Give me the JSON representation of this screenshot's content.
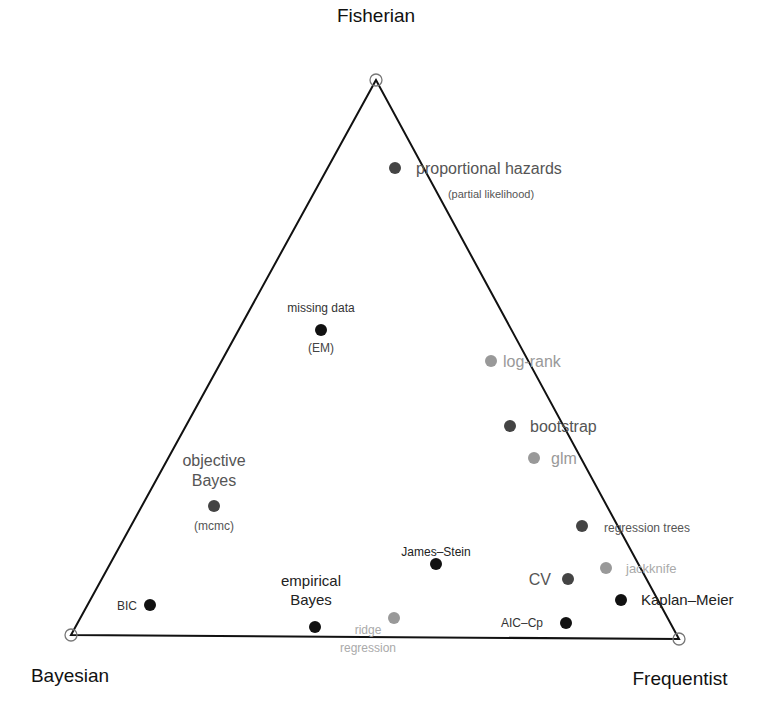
{
  "vertices": [
    {
      "id": "fisherian",
      "label": "Fisherian",
      "x": 376,
      "y": 80,
      "label_x": 376,
      "label_y": 22,
      "label_anchor": "middle",
      "font_size": 19
    },
    {
      "id": "bayesian",
      "label": "Bayesian",
      "x": 71,
      "y": 635,
      "label_x": 70,
      "label_y": 682,
      "label_anchor": "middle",
      "font_size": 19
    },
    {
      "id": "frequentist",
      "label": "Frequentist",
      "x": 679,
      "y": 639,
      "label_x": 680,
      "label_y": 685,
      "label_anchor": "middle",
      "font_size": 19
    }
  ],
  "triangle": {
    "stroke": "#111111",
    "stroke_width": 2,
    "vertex_circle_radius": 6
  },
  "colors": {
    "black": "#111111",
    "dark": "#444444",
    "gray": "#999999"
  },
  "points": [
    {
      "id": "proportional-hazards",
      "x": 395,
      "y": 168,
      "color": "dark",
      "labels": [
        {
          "text": "proportional hazards",
          "x": 416,
          "y": 174,
          "anchor": "start",
          "size": 16,
          "color": "#555555"
        },
        {
          "text": "(partial likelihood)",
          "x": 491,
          "y": 198,
          "anchor": "middle",
          "size": 11,
          "color": "#555555"
        }
      ]
    },
    {
      "id": "missing-data",
      "x": 321,
      "y": 330,
      "color": "black",
      "labels": [
        {
          "text": "missing data",
          "x": 321,
          "y": 312,
          "anchor": "middle",
          "size": 12,
          "color": "#333333"
        },
        {
          "text": "(EM)",
          "x": 321,
          "y": 352,
          "anchor": "middle",
          "size": 12,
          "color": "#444444"
        }
      ]
    },
    {
      "id": "log-rank",
      "x": 491,
      "y": 361,
      "color": "gray",
      "labels": [
        {
          "text": "log-rank",
          "x": 503,
          "y": 367,
          "anchor": "start",
          "size": 16,
          "color": "#999999"
        }
      ]
    },
    {
      "id": "bootstrap",
      "x": 510,
      "y": 426,
      "color": "dark",
      "labels": [
        {
          "text": "bootstrap",
          "x": 530,
          "y": 432,
          "anchor": "start",
          "size": 16,
          "color": "#555555"
        }
      ]
    },
    {
      "id": "glm",
      "x": 534,
      "y": 458,
      "color": "gray",
      "labels": [
        {
          "text": "glm",
          "x": 551,
          "y": 464,
          "anchor": "start",
          "size": 16,
          "color": "#999999"
        }
      ]
    },
    {
      "id": "objective-bayes",
      "x": 214,
      "y": 506,
      "color": "dark",
      "labels": [
        {
          "text": "objective",
          "x": 214,
          "y": 466,
          "anchor": "middle",
          "size": 16,
          "color": "#555555"
        },
        {
          "text": "Bayes",
          "x": 214,
          "y": 486,
          "anchor": "middle",
          "size": 16,
          "color": "#555555"
        },
        {
          "text": "(mcmc)",
          "x": 214,
          "y": 530,
          "anchor": "middle",
          "size": 12,
          "color": "#555555"
        }
      ]
    },
    {
      "id": "regression-trees",
      "x": 582,
      "y": 526,
      "color": "dark",
      "labels": [
        {
          "text": "regression trees",
          "x": 604,
          "y": 532,
          "anchor": "start",
          "size": 12,
          "color": "#555555"
        }
      ]
    },
    {
      "id": "james-stein",
      "x": 436,
      "y": 564,
      "color": "black",
      "labels": [
        {
          "text": "James–Stein",
          "x": 436,
          "y": 556,
          "anchor": "middle",
          "size": 12,
          "color": "#222222"
        }
      ]
    },
    {
      "id": "jackknife",
      "x": 606,
      "y": 568,
      "color": "gray",
      "labels": [
        {
          "text": "jackknife",
          "x": 626,
          "y": 573,
          "anchor": "start",
          "size": 13,
          "color": "#aaaaaa"
        }
      ]
    },
    {
      "id": "cv",
      "x": 568,
      "y": 579,
      "color": "dark",
      "labels": [
        {
          "text": "CV",
          "x": 551,
          "y": 585,
          "anchor": "end",
          "size": 16,
          "color": "#555555"
        }
      ]
    },
    {
      "id": "kaplan-meier",
      "x": 621,
      "y": 600,
      "color": "black",
      "labels": [
        {
          "text": "Kaplan–Meier",
          "x": 641,
          "y": 605,
          "anchor": "start",
          "size": 15,
          "color": "#222222"
        }
      ]
    },
    {
      "id": "bic",
      "x": 150,
      "y": 605,
      "color": "black",
      "labels": [
        {
          "text": "BIC",
          "x": 137,
          "y": 610,
          "anchor": "end",
          "size": 12,
          "color": "#333333"
        }
      ]
    },
    {
      "id": "empirical-bayes",
      "x": 315,
      "y": 627,
      "color": "black",
      "labels": [
        {
          "text": "empirical",
          "x": 311,
          "y": 586,
          "anchor": "middle",
          "size": 15,
          "color": "#222222"
        },
        {
          "text": "Bayes",
          "x": 311,
          "y": 605,
          "anchor": "middle",
          "size": 15,
          "color": "#222222"
        }
      ]
    },
    {
      "id": "ridge-regression",
      "x": 394,
      "y": 618,
      "color": "gray",
      "labels": [
        {
          "text": "ridge",
          "x": 368,
          "y": 634,
          "anchor": "middle",
          "size": 12,
          "color": "#aaaaaa"
        },
        {
          "text": "regression",
          "x": 368,
          "y": 652,
          "anchor": "middle",
          "size": 12,
          "color": "#aaaaaa"
        }
      ]
    },
    {
      "id": "aic-cp",
      "x": 566,
      "y": 623,
      "color": "black",
      "labels": [
        {
          "text": "AIC–Cp",
          "x": 543,
          "y": 627,
          "anchor": "end",
          "size": 12,
          "color": "#333333"
        }
      ]
    }
  ]
}
